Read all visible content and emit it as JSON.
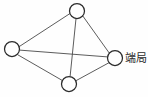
{
  "diagram": {
    "type": "node-link-network",
    "title": "",
    "background_color": "#fefefe",
    "node_stroke_color": "#2b2b2b",
    "node_fill_color": "#ffffff",
    "edge_color": "#4a4a4a",
    "label_color": "#2b2b2b",
    "nodes": [
      {
        "id": "top",
        "name": "node-top",
        "cx": 77,
        "cy": 11,
        "r": 7.5,
        "label": ""
      },
      {
        "id": "left",
        "name": "node-left",
        "cx": 12,
        "cy": 49,
        "r": 7.5,
        "label": ""
      },
      {
        "id": "right",
        "name": "node-right",
        "cx": 115,
        "cy": 58,
        "r": 7.5,
        "label": "端局"
      },
      {
        "id": "bottom",
        "name": "node-bottom",
        "cx": 69,
        "cy": 84,
        "r": 7.5,
        "label": ""
      }
    ],
    "edges": [
      {
        "from": "top",
        "to": "left",
        "x1": 70.0,
        "y1": 13.5,
        "x2": 19.2,
        "y2": 46.6
      },
      {
        "from": "top",
        "to": "right",
        "x1": 82.6,
        "y1": 15.7,
        "x2": 109.5,
        "y2": 53.4
      },
      {
        "from": "top",
        "to": "bottom",
        "x1": 76.0,
        "y1": 18.5,
        "x2": 70.1,
        "y2": 76.5
      },
      {
        "from": "left",
        "to": "right",
        "x1": 19.5,
        "y1": 50.1,
        "x2": 107.5,
        "y2": 56.9
      },
      {
        "from": "left",
        "to": "bottom",
        "x1": 17.8,
        "y1": 54.8,
        "x2": 62.0,
        "y2": 80.3
      },
      {
        "from": "right",
        "to": "bottom",
        "x1": 109.2,
        "y1": 62.6,
        "x2": 75.6,
        "y2": 80.9
      }
    ],
    "labels": [
      {
        "name": "end-office-label",
        "text": "端局",
        "x": 125,
        "y": 62,
        "for_node": "right"
      }
    ]
  }
}
